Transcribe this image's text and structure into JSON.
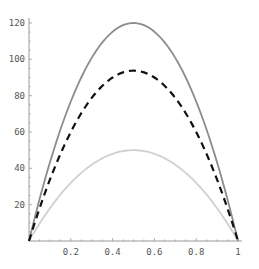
{
  "chart_data": {
    "type": "line",
    "title": "",
    "xlabel": "",
    "ylabel": "",
    "xlim": [
      0,
      1
    ],
    "ylim": [
      0,
      120
    ],
    "grid": false,
    "legend": null,
    "x_ticks": [
      0.2,
      0.4,
      0.6,
      0.8,
      1
    ],
    "x_tick_labels": [
      "0.2",
      "0.4",
      "0.6",
      "0.8",
      "1"
    ],
    "y_ticks": [
      20,
      40,
      60,
      80,
      100,
      120
    ],
    "y_tick_labels": [
      "20",
      "40",
      "60",
      "80",
      "100",
      "120"
    ],
    "x": [
      0,
      0.1,
      0.2,
      0.3,
      0.4,
      0.5,
      0.6,
      0.7,
      0.8,
      0.9,
      1
    ],
    "series": [
      {
        "name": "upper (solid gray)",
        "style": "solid",
        "color": "#8c8c8c",
        "peak": 120,
        "values": [
          0,
          43.2,
          76.8,
          100.8,
          115.2,
          120,
          115.2,
          100.8,
          76.8,
          43.2,
          0
        ]
      },
      {
        "name": "middle (dashed black)",
        "style": "dashed",
        "color": "#111111",
        "peak": 93.75,
        "values": [
          0,
          33.75,
          60,
          78.75,
          90,
          93.75,
          90,
          78.75,
          60,
          33.75,
          0
        ]
      },
      {
        "name": "lower (light gray)",
        "style": "solid",
        "color": "#d0d0d0",
        "peak": 50,
        "values": [
          0,
          18,
          32,
          42,
          48,
          50,
          48,
          42,
          32,
          18,
          0
        ]
      }
    ]
  }
}
